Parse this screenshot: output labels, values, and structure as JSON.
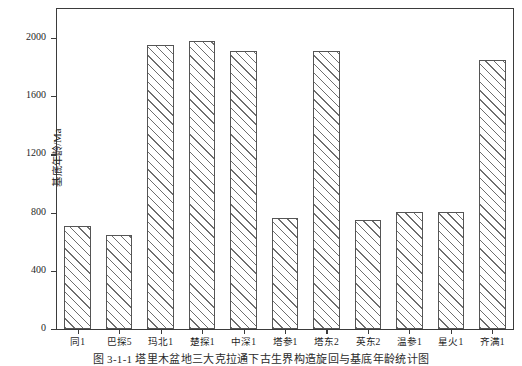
{
  "chart_data": {
    "type": "bar",
    "title": "",
    "xlabel": "",
    "ylabel": "基底年龄/Ma",
    "ylim": [
      0,
      2200
    ],
    "yticks": [
      0,
      400,
      800,
      1200,
      1600,
      2000
    ],
    "grid": false,
    "legend": null,
    "categories": [
      "同1",
      "巴探5",
      "玛北1",
      "楚探1",
      "中深1",
      "塔参1",
      "塔东2",
      "英东2",
      "温参1",
      "星火1",
      "齐满1"
    ],
    "values": [
      710,
      645,
      1950,
      1980,
      1910,
      765,
      1910,
      750,
      805,
      805,
      1850
    ],
    "bar_style": {
      "fill": "#ffffff",
      "edge": "#555555",
      "hatch": "diagonal-45"
    }
  },
  "caption": {
    "text": "图 3-1-1  塔里木盆地三大克拉通下古生界构造旋回与基底年龄统计图"
  },
  "axis": {
    "y_label": "基底年龄/Ma",
    "y_tick_labels": [
      "0",
      "400",
      "800",
      "1200",
      "1600",
      "2000"
    ]
  }
}
